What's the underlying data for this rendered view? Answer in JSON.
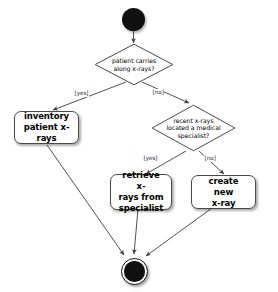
{
  "diagram": {
    "type": "uml-activity-diagram",
    "background_color": "#ffffff",
    "line_color": "#3c3c3c",
    "node_fill": "#ffffff",
    "node_border": "#4a4a4a",
    "node_marker_color": "#111111"
  },
  "nodes": {
    "start": {
      "name": "start-node",
      "shape": "filled-circle"
    },
    "decision_carries": {
      "shape": "diamond",
      "lines": [
        "patient carries",
        "along x-rays?"
      ],
      "text": "patient carries along x-rays?"
    },
    "action_inventory": {
      "shape": "rounded-rectangle",
      "lines": [
        "inventory",
        "patient x-rays"
      ],
      "text": "inventory patient x-rays"
    },
    "decision_specialist": {
      "shape": "diamond",
      "lines": [
        "recent x-rays",
        "located a medical",
        "specialist?"
      ],
      "text": "recent x-rays located a medical specialist?"
    },
    "action_retrieve": {
      "shape": "rounded-rectangle",
      "lines": [
        "retrieve x-",
        "rays from",
        "specialist"
      ],
      "text": "retrieve x-rays from specialist"
    },
    "action_create": {
      "shape": "rounded-rectangle",
      "lines": [
        "create new",
        "x-ray"
      ],
      "text": "create new x-ray"
    },
    "final": {
      "name": "final-node",
      "shape": "bullseye-circle"
    }
  },
  "guards": {
    "carries_yes": "[yes]",
    "carries_no": "[no]",
    "specialist_yes": "[yes]",
    "specialist_no": "[no]"
  },
  "edges": [
    {
      "from": "start",
      "to": "decision_carries",
      "label": ""
    },
    {
      "from": "decision_carries",
      "to": "action_inventory",
      "label": "[yes]"
    },
    {
      "from": "decision_carries",
      "to": "decision_specialist",
      "label": "[no]"
    },
    {
      "from": "decision_specialist",
      "to": "action_retrieve",
      "label": "[yes]"
    },
    {
      "from": "decision_specialist",
      "to": "action_create",
      "label": "[no]"
    },
    {
      "from": "action_inventory",
      "to": "final",
      "label": ""
    },
    {
      "from": "action_retrieve",
      "to": "final",
      "label": ""
    },
    {
      "from": "action_create",
      "to": "final",
      "label": ""
    }
  ]
}
